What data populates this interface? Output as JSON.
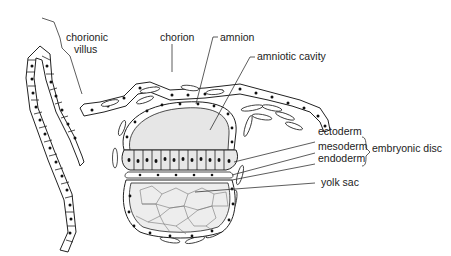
{
  "diagram": {
    "type": "anatomical-illustration",
    "labels": {
      "chorionic_villus_line1": "chorionic",
      "chorionic_villus_line2": "villus",
      "chorion": "chorion",
      "amnion": "amnion",
      "amniotic_cavity": "amniotic cavity",
      "ectoderm": "ectoderm",
      "mesoderm": "mesoderm",
      "endoderm": "endoderm",
      "embryonic_disc": "embryonic disc",
      "yolk_sac": "yolk sac"
    },
    "colors": {
      "line": "#222222",
      "cavity_fill": "#e6e6e6",
      "yolk_fill": "#ededed",
      "background": "#ffffff"
    }
  }
}
